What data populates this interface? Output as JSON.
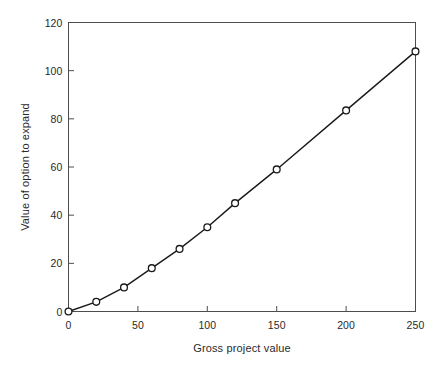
{
  "chart_data": {
    "type": "line",
    "title": "",
    "xlabel": "Gross project value",
    "ylabel": "Value of option to expand",
    "xlim": [
      0,
      250
    ],
    "ylim": [
      0,
      120
    ],
    "xticks": [
      0,
      50,
      100,
      150,
      200,
      250
    ],
    "yticks": [
      0,
      20,
      40,
      60,
      80,
      100,
      120
    ],
    "xtick_labels": [
      "0",
      "50",
      "100",
      "150",
      "200",
      "250"
    ],
    "ytick_labels": [
      "0",
      "20",
      "40",
      "60",
      "80",
      "100",
      "120"
    ],
    "grid": false,
    "legend": null,
    "marker": "circle-open",
    "line_color": "#1a1a1a",
    "marker_edge_color": "#1a1a1a",
    "marker_face_color": "#ffffff",
    "frame": true,
    "series": [
      {
        "name": "Value of option to expand",
        "x": [
          0,
          20,
          40,
          60,
          80,
          100,
          120,
          150,
          200,
          250
        ],
        "values": [
          0,
          4,
          10,
          18,
          26,
          35,
          45,
          59,
          83.5,
          108
        ]
      }
    ]
  },
  "axes": {
    "xlabel": "Gross project value",
    "ylabel": "Value of option to expand"
  }
}
